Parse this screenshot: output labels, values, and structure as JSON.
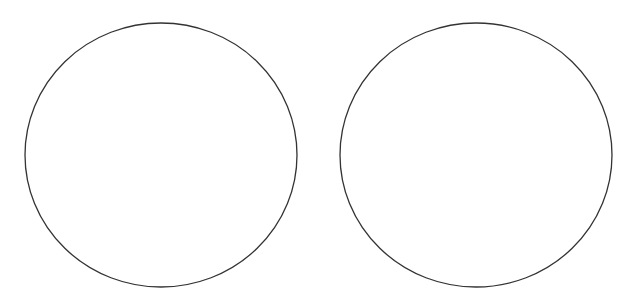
{
  "canvas": {
    "width": 625,
    "height": 308,
    "background": "#ffffff"
  },
  "shapes": [
    {
      "name": "left-circle",
      "cx": 161,
      "cy": 155,
      "rx": 136,
      "ry": 132,
      "stroke": "#333333",
      "stroke_width": 1.3,
      "fill": "none"
    },
    {
      "name": "right-circle",
      "cx": 476,
      "cy": 155,
      "rx": 136,
      "ry": 132,
      "stroke": "#333333",
      "stroke_width": 1.3,
      "fill": "none"
    }
  ]
}
